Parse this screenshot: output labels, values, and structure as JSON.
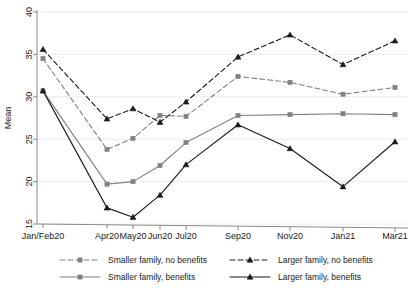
{
  "chart_data": {
    "type": "line",
    "title": "",
    "xlabel": "",
    "ylabel": "Mean",
    "categories": [
      "Jan/Feb20",
      "Apr20",
      "May20",
      "Jun20",
      "Jul20",
      "Sep20",
      "Nov20",
      "Jan21",
      "Mar21"
    ],
    "x_positions": [
      43,
      107,
      133,
      160,
      186,
      238,
      290,
      343,
      395
    ],
    "ylim": [
      15,
      40
    ],
    "yticks": [
      15,
      20,
      25,
      30,
      35,
      40
    ],
    "ytick_labels": [
      "15",
      "20",
      "25",
      "30",
      "35",
      "40"
    ],
    "grid": true,
    "legend_position": "bottom",
    "series": [
      {
        "name": "Smaller family, no benefits",
        "key": "smaller_no_benefits",
        "style": "dashed",
        "marker": "square",
        "color": "#808080",
        "values": [
          34.5,
          23.8,
          25.1,
          27.8,
          27.7,
          32.4,
          31.7,
          30.3,
          31.1
        ]
      },
      {
        "name": "Larger family, no benefits",
        "key": "larger_no_benefits",
        "style": "dashed",
        "marker": "triangle",
        "color": "#1a1a1a",
        "values": [
          35.6,
          27.4,
          28.6,
          27.0,
          29.4,
          34.7,
          37.3,
          33.8,
          36.6
        ]
      },
      {
        "name": "Smaller family, benefits",
        "key": "smaller_benefits",
        "style": "solid",
        "marker": "square",
        "color": "#808080",
        "values": [
          30.7,
          19.7,
          20.0,
          21.9,
          24.6,
          27.8,
          27.9,
          28.0,
          27.9
        ]
      },
      {
        "name": "Larger family, benefits",
        "key": "larger_benefits",
        "style": "solid",
        "marker": "triangle",
        "color": "#1a1a1a",
        "values": [
          30.7,
          16.9,
          15.8,
          18.4,
          22.0,
          26.7,
          23.9,
          19.4,
          24.7
        ]
      }
    ]
  },
  "legend": {
    "entries": [
      {
        "label": "Smaller family, no benefits"
      },
      {
        "label": "Larger family, no benefits"
      },
      {
        "label": "Smaller family, benefits"
      },
      {
        "label": "Larger family, benefits"
      }
    ]
  }
}
